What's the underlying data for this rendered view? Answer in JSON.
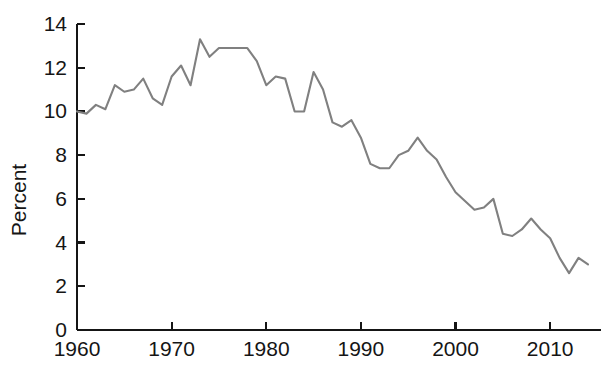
{
  "chart_data": {
    "type": "line",
    "title": "",
    "subtitle": "",
    "xlabel": "",
    "ylabel": "Percent",
    "xlim": [
      1960,
      2014
    ],
    "ylim": [
      0,
      14
    ],
    "grid": false,
    "legend": null,
    "line_color": "#808080",
    "axis_color": "#151515",
    "x_ticks": [
      1960,
      1970,
      1980,
      1990,
      2000,
      2010
    ],
    "x_tick_labels": [
      "1960",
      "1970",
      "1980",
      "1990",
      "2000",
      "2010"
    ],
    "y_ticks": [
      0,
      2,
      4,
      6,
      8,
      10,
      12,
      14
    ],
    "y_tick_labels": [
      "0",
      "2",
      "4",
      "6",
      "8",
      "10",
      "12",
      "14"
    ],
    "series": [
      {
        "name": "Personal saving rate",
        "x": [
          1960,
          1961,
          1962,
          1963,
          1964,
          1965,
          1966,
          1967,
          1968,
          1969,
          1970,
          1971,
          1972,
          1973,
          1974,
          1975,
          1976,
          1977,
          1978,
          1979,
          1980,
          1981,
          1982,
          1983,
          1984,
          1985,
          1986,
          1987,
          1988,
          1989,
          1990,
          1991,
          1992,
          1993,
          1994,
          1995,
          1996,
          1997,
          1998,
          1999,
          2000,
          2001,
          2002,
          2003,
          2004,
          2005,
          2006,
          2007,
          2008,
          2009,
          2010,
          2011,
          2012,
          2013,
          2014
        ],
        "values": [
          10.0,
          9.9,
          10.3,
          10.1,
          11.2,
          10.9,
          11.0,
          11.5,
          10.6,
          10.3,
          11.6,
          12.1,
          11.2,
          13.3,
          12.5,
          12.9,
          12.9,
          12.9,
          12.9,
          12.3,
          11.2,
          11.6,
          11.5,
          10.0,
          10.0,
          11.8,
          11.0,
          9.5,
          9.3,
          9.6,
          8.8,
          7.6,
          7.4,
          7.4,
          8.0,
          8.2,
          8.8,
          8.2,
          7.8,
          7.0,
          6.3,
          5.9,
          5.5,
          5.6,
          6.0,
          4.4,
          4.3,
          4.6,
          5.1,
          4.6,
          4.2,
          3.3,
          2.6,
          3.3,
          3.0
        ]
      }
    ]
  }
}
